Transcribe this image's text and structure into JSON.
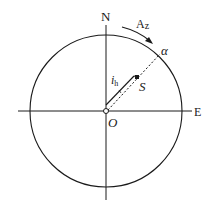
{
  "diagram": {
    "type": "azimuth-compass",
    "labels": {
      "north": "N",
      "east": "E",
      "origin": "O",
      "azimuth": "Az",
      "azimuth_main": "A",
      "azimuth_sub": "z",
      "alpha": "α",
      "source": "S",
      "ih_main": "i",
      "ih_sub": "h"
    },
    "colors": {
      "stroke": "#1a1a1a",
      "background": "#ffffff"
    }
  }
}
